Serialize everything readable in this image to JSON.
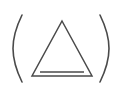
{
  "figure": {
    "name": "triangle-in-parentheses-logo",
    "width": 122,
    "height": 108,
    "background_color": "#ffffff",
    "stroke_color": "#4a4a4a"
  },
  "elements": {
    "left_paren": {
      "label": "left-parenthesis",
      "icon": "left-parenthesis-arc-icon",
      "top_point": [
        22,
        15
      ],
      "bulge_point": [
        13,
        48
      ],
      "bottom_point": [
        22,
        82
      ],
      "stroke_width": 1.6
    },
    "right_paren": {
      "label": "right-parenthesis",
      "icon": "right-parenthesis-arc-icon",
      "top_point": [
        100,
        15
      ],
      "bulge_point": [
        109,
        48
      ],
      "bottom_point": [
        100,
        82
      ],
      "stroke_width": 1.6
    },
    "triangle": {
      "label": "triangle-outline",
      "icon": "triangle-outline-icon",
      "apex": [
        62,
        21
      ],
      "bottom_left": [
        32,
        76
      ],
      "bottom_right": [
        92,
        76
      ],
      "stroke_width": 1.5
    },
    "inner_bar": {
      "label": "inner-horizontal-bar",
      "icon": "horizontal-bar-icon",
      "start_point": [
        40,
        72
      ],
      "end_point": [
        84,
        72
      ],
      "stroke_width": 1.5
    }
  }
}
